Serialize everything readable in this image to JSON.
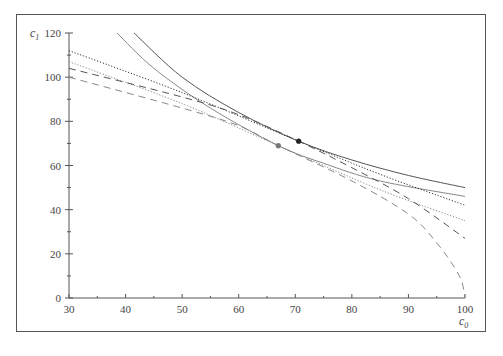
{
  "chart_data": {
    "type": "line",
    "title": "",
    "xlabel": "c0",
    "ylabel": "c1",
    "xlim": [
      30,
      100
    ],
    "ylim": [
      0,
      120
    ],
    "x_ticks": [
      30,
      40,
      50,
      60,
      70,
      80,
      90,
      100
    ],
    "y_ticks": [
      0,
      20,
      40,
      60,
      80,
      100,
      120
    ],
    "grid": false,
    "legend": null,
    "series": [
      {
        "name": "indifference-curve-1",
        "style": "solid",
        "color": "#555555",
        "points": [
          [
            41.5,
            120
          ],
          [
            50,
            100
          ],
          [
            60,
            84
          ],
          [
            70.6,
            71
          ],
          [
            80,
            62.5
          ],
          [
            90,
            55.5
          ],
          [
            100,
            50
          ]
        ]
      },
      {
        "name": "indifference-curve-2",
        "style": "solid",
        "color": "#888888",
        "points": [
          [
            38.5,
            120
          ],
          [
            45,
            104
          ],
          [
            55,
            86
          ],
          [
            67,
            69
          ],
          [
            75,
            61
          ],
          [
            85,
            53
          ],
          [
            100,
            46
          ]
        ]
      },
      {
        "name": "budget-line-dotted-1",
        "style": "dotted",
        "color": "#333333",
        "points": [
          [
            30,
            112
          ],
          [
            50,
            93
          ],
          [
            70.6,
            71
          ],
          [
            85,
            56
          ],
          [
            100,
            42
          ]
        ]
      },
      {
        "name": "budget-line-dotted-2",
        "style": "dotted",
        "color": "#888888",
        "points": [
          [
            30,
            107
          ],
          [
            50,
            88
          ],
          [
            67,
            69
          ],
          [
            85,
            49
          ],
          [
            100,
            35
          ]
        ]
      },
      {
        "name": "frontier-dashed-1",
        "style": "dashed",
        "color": "#555555",
        "points": [
          [
            30,
            104
          ],
          [
            50,
            91
          ],
          [
            60,
            83
          ],
          [
            70.6,
            71
          ],
          [
            80,
            59
          ],
          [
            90,
            45
          ],
          [
            100,
            27
          ]
        ]
      },
      {
        "name": "frontier-dashed-2",
        "style": "dashed",
        "color": "#888888",
        "points": [
          [
            30,
            100
          ],
          [
            50,
            86
          ],
          [
            60,
            78
          ],
          [
            67,
            69
          ],
          [
            80,
            53
          ],
          [
            90,
            38
          ],
          [
            95,
            25
          ],
          [
            99,
            10
          ],
          [
            100,
            0
          ]
        ]
      }
    ],
    "markers": [
      {
        "name": "tangency-point-dark",
        "x": 70.6,
        "y": 71,
        "color": "#222222"
      },
      {
        "name": "tangency-point-gray",
        "x": 67,
        "y": 69,
        "color": "#777777"
      }
    ]
  },
  "axes": {
    "x_title": "c",
    "x_sub": "0",
    "y_title": "c",
    "y_sub": "1"
  }
}
